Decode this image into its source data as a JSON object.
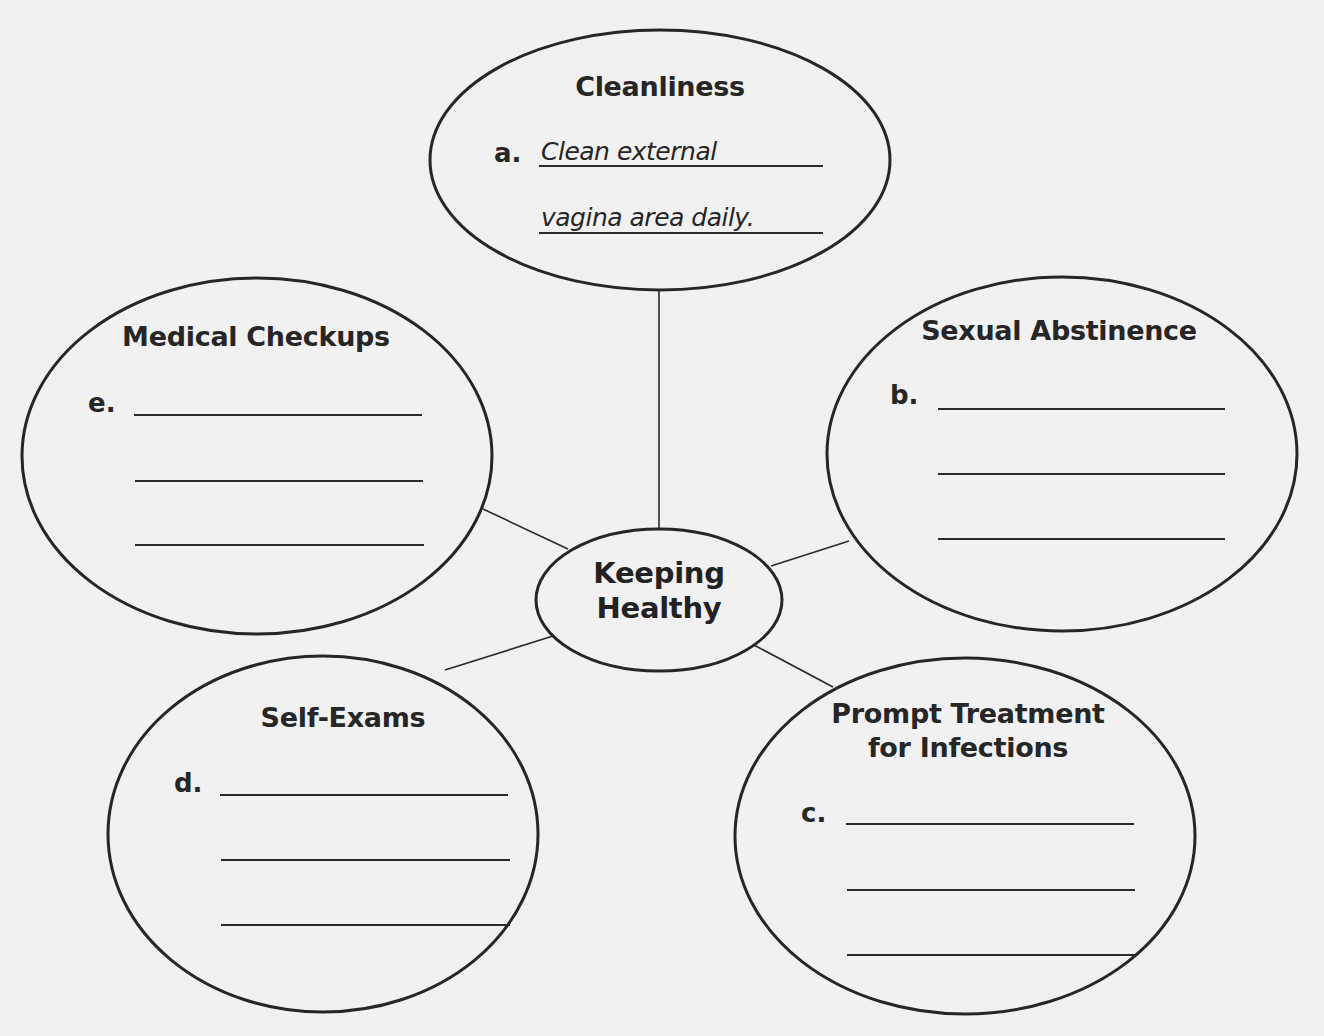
{
  "diagram": {
    "type": "web-organizer",
    "center": {
      "title_line1": "Keeping",
      "title_line2": "Healthy"
    },
    "nodes": [
      {
        "id": "cleanliness",
        "title": "Cleanliness",
        "letter": "a.",
        "answer_lines": [
          "Clean external",
          "vagina area daily."
        ]
      },
      {
        "id": "sexual-abstinence",
        "title": "Sexual Abstinence",
        "letter": "b.",
        "answer_lines": [
          "",
          "",
          ""
        ]
      },
      {
        "id": "prompt-treatment",
        "title_line1": "Prompt Treatment",
        "title_line2": "for Infections",
        "letter": "c.",
        "answer_lines": [
          "",
          "",
          ""
        ]
      },
      {
        "id": "self-exams",
        "title": "Self-Exams",
        "letter": "d.",
        "answer_lines": [
          "",
          "",
          ""
        ]
      },
      {
        "id": "medical-checkups",
        "title": "Medical Checkups",
        "letter": "e.",
        "answer_lines": [
          "",
          "",
          ""
        ]
      }
    ],
    "colors": {
      "stroke": "#262626",
      "text": "#262626",
      "paper": "#f1f1f1"
    }
  }
}
